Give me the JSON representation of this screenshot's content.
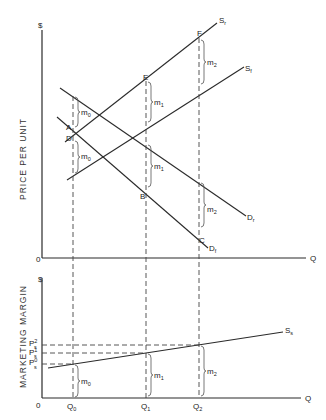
{
  "diagram": {
    "type": "economics supply-demand and marketing margin diagram",
    "top_panel": {
      "y_axis_symbol": "$",
      "y_axis_label": "PRICE PER UNIT",
      "x_axis_label": "Q",
      "origin_label": "0",
      "curves": {
        "Sr": {
          "label": "S",
          "sub": "r"
        },
        "Sf": {
          "label": "S",
          "sub": "f"
        },
        "Dr": {
          "label": "D",
          "sub": "r"
        },
        "Df": {
          "label": "D",
          "sub": "f"
        }
      },
      "points": {
        "A": "A",
        "D": "D",
        "B": "B",
        "C": "C",
        "E": "E",
        "F": "F"
      },
      "margins": {
        "m0_upper": {
          "label": "m",
          "sub": "0"
        },
        "m0_lower": {
          "label": "m",
          "sub": "0"
        },
        "m1_upper": {
          "label": "m",
          "sub": "1"
        },
        "m1_lower": {
          "label": "m",
          "sub": "1"
        },
        "m2_upper": {
          "label": "m",
          "sub": "2"
        },
        "m2_lower": {
          "label": "m",
          "sub": "2"
        }
      }
    },
    "bottom_panel": {
      "y_axis_symbol": "$",
      "y_axis_label": "MARKETING MARGIN",
      "x_axis_label": "Q",
      "origin_label": "0",
      "curve": {
        "label": "S",
        "sub": "s"
      },
      "price_ticks": [
        {
          "label": "P",
          "sub": "s",
          "sup": "2"
        },
        {
          "label": "P",
          "sub": "s",
          "sup": "1"
        },
        {
          "label": "P",
          "sub": "s",
          "sup": "0"
        }
      ],
      "quantity_ticks": [
        {
          "label": "Q",
          "sub": "0"
        },
        {
          "label": "Q",
          "sub": "1"
        },
        {
          "label": "Q",
          "sub": "2"
        }
      ],
      "margins": {
        "m0": {
          "label": "m",
          "sub": "0"
        },
        "m1": {
          "label": "m",
          "sub": "1"
        },
        "m2": {
          "label": "m",
          "sub": "2"
        }
      }
    }
  }
}
